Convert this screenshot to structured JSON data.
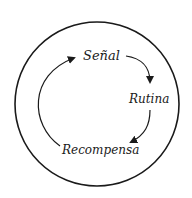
{
  "diagram": {
    "type": "habit-loop",
    "nodes": [
      {
        "id": "senal",
        "label": "Señal"
      },
      {
        "id": "rutina",
        "label": "Rutina"
      },
      {
        "id": "recompensa",
        "label": "Recompensa"
      }
    ],
    "edges": [
      {
        "from": "senal",
        "to": "rutina"
      },
      {
        "from": "rutina",
        "to": "recompensa"
      },
      {
        "from": "recompensa",
        "to": "senal"
      }
    ],
    "colors": {
      "stroke": "#1a1a1a",
      "background": "#ffffff"
    }
  }
}
